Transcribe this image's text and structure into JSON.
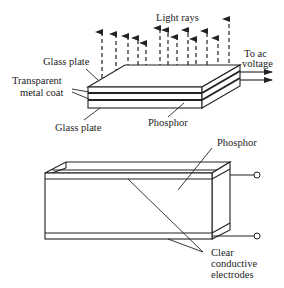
{
  "top_diagram": {
    "title": "Electroluminescent panel layers",
    "labels": {
      "light_rays": "Light rays",
      "to_ac_line1": "To ac",
      "to_ac_line2": "voltage",
      "glass_plate_top": "Glass plate",
      "transparent_line1": "Transparent",
      "transparent_line2": "metal coat",
      "glass_plate_bottom": "Glass plate",
      "phosphor": "Phosphor"
    },
    "arrow_count": 12
  },
  "bottom_diagram": {
    "title": "Phosphor between electrodes",
    "labels": {
      "phosphor": "Phosphor",
      "clear_line1": "Clear",
      "clear_line2": "conductive",
      "clear_line3": "electrodes"
    },
    "terminal_count": 2
  },
  "colors": {
    "ink": "#222222",
    "background": "#ffffff"
  }
}
